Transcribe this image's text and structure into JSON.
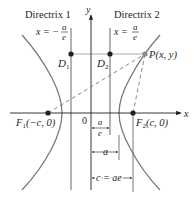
{
  "figure": {
    "colors": {
      "curve": "#7a7a7a",
      "axis": "#231f20",
      "line": "#555555",
      "dashed": "#7a7a7a",
      "point": "#231f20",
      "p_point": "#8a8a8a"
    }
  },
  "labels": {
    "directrix1": "Directrix 1",
    "directrix2": "Directrix 2",
    "eq1_lhs": "x = −",
    "eq2_lhs": "x =",
    "frac_num": "a",
    "frac_den": "e",
    "y_axis": "y",
    "x_axis": "x",
    "origin": "0",
    "d1": "D",
    "d1_sub": "1",
    "d2": "D",
    "d2_sub": "2",
    "p": "P(x, y)",
    "f1_name": "F",
    "f1_sub": "1",
    "f1_coords": "(−c, 0)",
    "f2_name": "F",
    "f2_sub": "2",
    "f2_coords": "(c, 0)",
    "dim_ae_num": "a",
    "dim_ae_den": "e",
    "dim_a": "a",
    "dim_c": "c = ae"
  }
}
